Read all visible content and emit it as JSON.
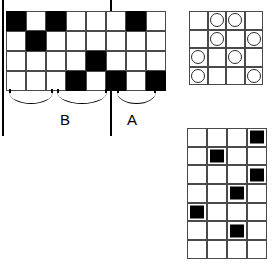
{
  "figure": {
    "colors": {
      "fill": "#000000",
      "background": "#ffffff",
      "gridline": "#4a4a4a"
    }
  },
  "left_figure": {
    "name": "black-and-white checkerboard strip",
    "columns": 8,
    "rows": 4,
    "cells": [
      [
        1,
        0,
        1,
        0,
        0,
        0,
        1,
        0
      ],
      [
        0,
        1,
        0,
        0,
        0,
        0,
        0,
        0
      ],
      [
        0,
        0,
        0,
        0,
        1,
        0,
        0,
        0
      ],
      [
        0,
        0,
        0,
        1,
        0,
        1,
        0,
        1
      ]
    ],
    "brackets": [
      {
        "id": "bracket-b-left",
        "spans_columns": "1-3"
      },
      {
        "id": "bracket-b-right",
        "spans_columns": "4-6"
      },
      {
        "id": "bracket-a",
        "spans_columns": "7-8"
      }
    ],
    "labels": {
      "b": "B",
      "a": "A"
    }
  },
  "circle_figure": {
    "name": "four by four circle grid",
    "columns": 4,
    "rows": 4,
    "cells": [
      [
        0,
        1,
        1,
        0
      ],
      [
        0,
        1,
        0,
        1
      ],
      [
        1,
        0,
        1,
        0
      ],
      [
        1,
        0,
        0,
        1
      ]
    ]
  },
  "square_figure": {
    "name": "four by seven inset square grid",
    "columns": 4,
    "rows": 7,
    "cells": [
      [
        0,
        0,
        0,
        1
      ],
      [
        0,
        1,
        0,
        0
      ],
      [
        0,
        0,
        0,
        1
      ],
      [
        0,
        0,
        1,
        0
      ],
      [
        1,
        0,
        0,
        0
      ],
      [
        0,
        0,
        1,
        0
      ],
      [
        0,
        0,
        0,
        0
      ]
    ]
  }
}
